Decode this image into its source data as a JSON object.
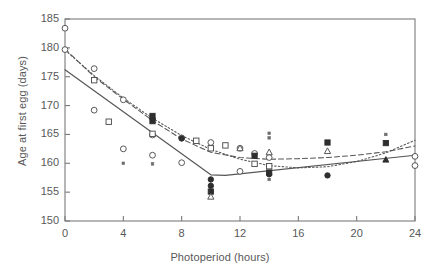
{
  "chart_data": {
    "type": "scatter",
    "title": "",
    "xlabel": "Photoperiod (hours)",
    "ylabel": "Age at first egg (days)",
    "xlim": [
      0,
      24
    ],
    "ylim": [
      150,
      185
    ],
    "xticks": [
      0,
      4,
      8,
      12,
      16,
      20,
      24
    ],
    "yticks": [
      150,
      155,
      160,
      165,
      170,
      175,
      180,
      185
    ],
    "grid": false,
    "legend": "none",
    "frame": "box",
    "series": [
      {
        "name": "open-circle",
        "marker": "open-circle",
        "points": [
          {
            "x": 0,
            "y": 183.4
          },
          {
            "x": 0,
            "y": 179.7
          },
          {
            "x": 2,
            "y": 176.4
          },
          {
            "x": 2,
            "y": 169.2
          },
          {
            "x": 4,
            "y": 171.0
          },
          {
            "x": 4,
            "y": 162.5
          },
          {
            "x": 6,
            "y": 164.9
          },
          {
            "x": 6,
            "y": 161.4
          },
          {
            "x": 8,
            "y": 164.4
          },
          {
            "x": 8,
            "y": 160.1
          },
          {
            "x": 10,
            "y": 163.6
          },
          {
            "x": 12,
            "y": 162.6
          },
          {
            "x": 12,
            "y": 158.6
          },
          {
            "x": 13,
            "y": 161.7
          },
          {
            "x": 14,
            "y": 161.0
          },
          {
            "x": 24,
            "y": 161.2
          },
          {
            "x": 24,
            "y": 159.6
          }
        ]
      },
      {
        "name": "open-square",
        "marker": "open-square",
        "points": [
          {
            "x": 2,
            "y": 174.4
          },
          {
            "x": 3,
            "y": 167.2
          },
          {
            "x": 6,
            "y": 165.1
          },
          {
            "x": 9,
            "y": 163.9
          },
          {
            "x": 10,
            "y": 162.6
          },
          {
            "x": 11,
            "y": 163.1
          },
          {
            "x": 13,
            "y": 159.9
          },
          {
            "x": 14,
            "y": 159.5
          }
        ]
      },
      {
        "name": "filled-circle",
        "marker": "filled-circle",
        "points": [
          {
            "x": 6,
            "y": 167.7
          },
          {
            "x": 8,
            "y": 164.3
          },
          {
            "x": 10,
            "y": 157.2
          },
          {
            "x": 10,
            "y": 156.1
          },
          {
            "x": 14,
            "y": 158.1
          },
          {
            "x": 18,
            "y": 157.9
          }
        ]
      },
      {
        "name": "filled-square",
        "marker": "filled-square",
        "points": [
          {
            "x": 6,
            "y": 168.2
          },
          {
            "x": 6,
            "y": 167.3
          },
          {
            "x": 10,
            "y": 155.1
          },
          {
            "x": 13,
            "y": 161.3
          },
          {
            "x": 14,
            "y": 158.4
          },
          {
            "x": 18,
            "y": 163.6
          },
          {
            "x": 22,
            "y": 163.5
          }
        ]
      },
      {
        "name": "open-triangle",
        "marker": "open-triangle",
        "points": [
          {
            "x": 10,
            "y": 154.2
          },
          {
            "x": 12,
            "y": 162.6
          },
          {
            "x": 14,
            "y": 161.9
          },
          {
            "x": 18,
            "y": 162.1
          }
        ]
      },
      {
        "name": "filled-triangle",
        "marker": "filled-triangle",
        "points": [
          {
            "x": 22,
            "y": 160.6
          }
        ]
      },
      {
        "name": "small-marker",
        "marker": "small-dot",
        "points": [
          {
            "x": 4,
            "y": 160.0
          },
          {
            "x": 6,
            "y": 159.9
          },
          {
            "x": 14,
            "y": 165.2
          },
          {
            "x": 14,
            "y": 164.4
          },
          {
            "x": 14,
            "y": 157.2
          },
          {
            "x": 22,
            "y": 165.0
          }
        ]
      }
    ],
    "fit_lines": [
      {
        "name": "solid-segmented-fit",
        "style": "solid",
        "points": [
          {
            "x": 0,
            "y": 176.2
          },
          {
            "x": 10,
            "y": 158.0
          },
          {
            "x": 11,
            "y": 157.9
          },
          {
            "x": 24,
            "y": 161.4
          }
        ]
      },
      {
        "name": "dashed-fit",
        "style": "dashed",
        "points": [
          {
            "x": 0,
            "y": 179.8
          },
          {
            "x": 2,
            "y": 175.0
          },
          {
            "x": 4,
            "y": 171.1
          },
          {
            "x": 6,
            "y": 167.4
          },
          {
            "x": 8,
            "y": 164.2
          },
          {
            "x": 10,
            "y": 161.9
          },
          {
            "x": 12,
            "y": 161.0
          },
          {
            "x": 14,
            "y": 160.7
          },
          {
            "x": 16,
            "y": 160.8
          },
          {
            "x": 18,
            "y": 161.0
          },
          {
            "x": 20,
            "y": 161.4
          },
          {
            "x": 22,
            "y": 162.0
          },
          {
            "x": 24,
            "y": 163.0
          }
        ]
      },
      {
        "name": "dotted-fit",
        "style": "dotted",
        "points": [
          {
            "x": 0,
            "y": 179.6
          },
          {
            "x": 2,
            "y": 175.2
          },
          {
            "x": 4,
            "y": 171.3
          },
          {
            "x": 6,
            "y": 167.8
          },
          {
            "x": 8,
            "y": 164.8
          },
          {
            "x": 10,
            "y": 162.4
          },
          {
            "x": 12,
            "y": 160.7
          },
          {
            "x": 14,
            "y": 159.6
          },
          {
            "x": 16,
            "y": 159.2
          },
          {
            "x": 18,
            "y": 159.4
          },
          {
            "x": 20,
            "y": 160.3
          },
          {
            "x": 22,
            "y": 161.8
          },
          {
            "x": 24,
            "y": 164.0
          }
        ]
      }
    ]
  },
  "colors": {
    "axis": "#7a7a7a",
    "text": "#585858",
    "marker_stroke": "#4f4f4f",
    "marker_fill": "#2e2e2e",
    "line": "#555555",
    "background": "#ffffff"
  }
}
